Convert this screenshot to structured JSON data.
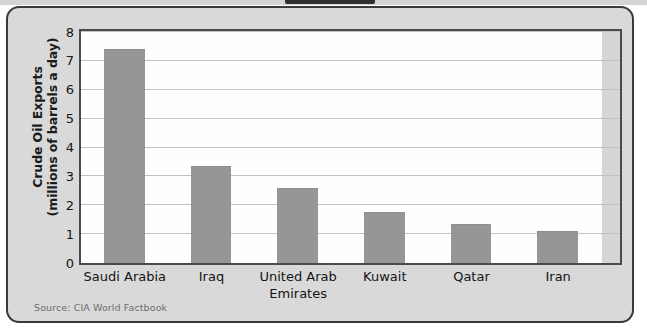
{
  "figure": {
    "y_axis_title_line1": "Crude Oil Exports",
    "y_axis_title_line2": "(millions of barrels a day)",
    "source_note": "Source: CIA World Factbook"
  },
  "chart_data": {
    "type": "bar",
    "title": "",
    "xlabel": "",
    "ylabel": "Crude Oil Exports (millions of barrels a day)",
    "categories": [
      "Saudi Arabia",
      "Iraq",
      "United Arab Emirates",
      "Kuwait",
      "Qatar",
      "Iran"
    ],
    "category_lines": [
      [
        "Saudi Arabia"
      ],
      [
        "Iraq"
      ],
      [
        "United Arab",
        "Emirates"
      ],
      [
        "Kuwait"
      ],
      [
        "Qatar"
      ],
      [
        "Iran"
      ]
    ],
    "values": [
      7.4,
      3.35,
      2.6,
      1.75,
      1.35,
      1.1
    ],
    "ylim": [
      0,
      8
    ],
    "yticks": [
      0,
      1,
      2,
      3,
      4,
      5,
      6,
      7,
      8
    ],
    "ytick_labels": [
      "0",
      "1",
      "2",
      "3",
      "4",
      "5",
      "6",
      "7",
      "8"
    ],
    "grid": true,
    "legend": "none",
    "bar_color": "#969696",
    "plot_background": "#fefefe",
    "panel_background": "#d9d9d9",
    "frame_color": "#4a4a4a"
  }
}
